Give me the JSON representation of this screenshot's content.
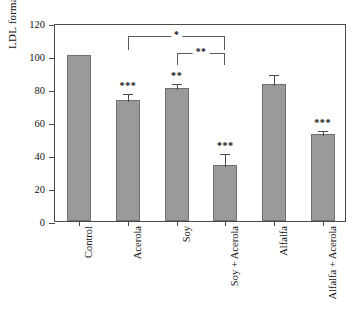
{
  "chart_data": {
    "type": "bar",
    "title": "",
    "xlabel": "",
    "ylabel": "LDL formation (%)",
    "ylim": [
      0,
      120
    ],
    "ytick_values": [
      0,
      20,
      40,
      60,
      80,
      100,
      120
    ],
    "ytick_labels": [
      "0",
      "20",
      "40",
      "60",
      "80",
      "100",
      "120"
    ],
    "grid": false,
    "legend": null,
    "categories": [
      "Control",
      "Acerola",
      "Soy",
      "Soy + Acerola",
      "Alfalfa",
      "Alfalfa + Acerola"
    ],
    "values": [
      100.5,
      73.5,
      80.5,
      34.0,
      83.0,
      52.5
    ],
    "errors": [
      0.0,
      4.5,
      3.5,
      8.0,
      6.5,
      3.5
    ],
    "significance_labels": [
      "",
      "***",
      "**",
      "***",
      "",
      "***"
    ],
    "annotations": [
      {
        "label": "*",
        "from": "Acerola",
        "to": "Soy + Acerola"
      },
      {
        "label": "**",
        "from": "Soy",
        "to": "Soy + Acerola"
      }
    ],
    "bar_color": "#9a9a9a",
    "bar_edge_color": "#6f6f6f",
    "axis_color": "#4a4a4a"
  }
}
